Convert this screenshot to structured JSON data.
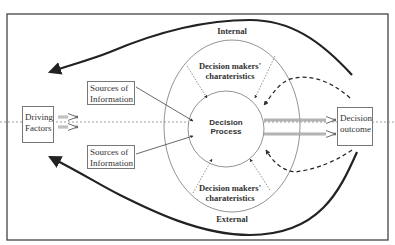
{
  "diagram": {
    "labels": {
      "internal": "Internal",
      "external": "External",
      "dm_char_top_line1": "Decision makers'",
      "dm_char_top_line2": "charateristics",
      "dm_char_bottom_line1": "Decision makers'",
      "dm_char_bottom_line2": "charateristics",
      "decision_process_line1": "Decision",
      "decision_process_line2": "Process"
    },
    "boxes": {
      "driving_factors_line1": "Driving",
      "driving_factors_line2": "Factors",
      "sources_top_line1": "Sources of",
      "sources_top_line2": "Information",
      "sources_bottom_line1": "Sources of",
      "sources_bottom_line2": "Information",
      "decision_outcome_line1": "Decision",
      "decision_outcome_line2": "outcome"
    },
    "colors": {
      "line": "#222222",
      "thin_line": "#666666",
      "dotted": "#777777"
    }
  }
}
